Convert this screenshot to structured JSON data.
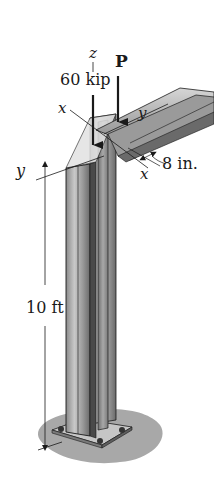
{
  "figure": {
    "type": "engineering-diagram",
    "labels": {
      "axis_z": "z",
      "axis_x_top": "x",
      "axis_y_beam": "y",
      "axis_y_left": "y",
      "axis_x_bottom": "x",
      "load_axial": "60 kip",
      "load_p": "P",
      "offset": "8 in.",
      "height": "10 ft"
    },
    "colors": {
      "background": "#ffffff",
      "steel_light": "#d0d0d0",
      "steel_mid": "#9a9a9a",
      "steel_dark": "#5e5e5e",
      "ground_shadow": "#a8a8a8",
      "line": "#1a1a1a"
    }
  }
}
